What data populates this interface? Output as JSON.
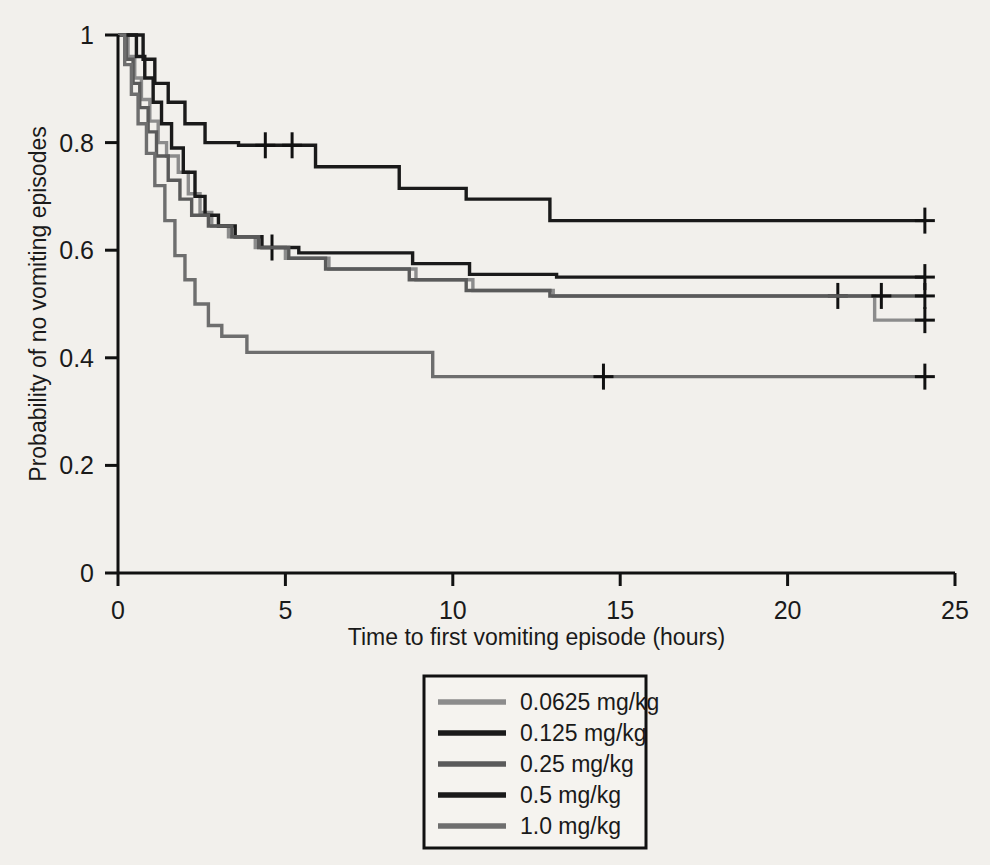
{
  "chart_data": {
    "type": "line",
    "subtype": "kaplan-meier-step",
    "title": "",
    "xlabel": "Time to first vomiting episode (hours)",
    "ylabel": "Probability of no vomiting episodes",
    "xlim": [
      0,
      25
    ],
    "ylim": [
      0,
      1
    ],
    "xticks": [
      0,
      5,
      10,
      15,
      20,
      25
    ],
    "xtick_labels": [
      "0",
      "5",
      "10",
      "15",
      "20",
      "25"
    ],
    "yticks": [
      0,
      0.2,
      0.4,
      0.6,
      0.8,
      1
    ],
    "ytick_labels": [
      "0",
      "0.2",
      "0.4",
      "0.6",
      "0.8",
      "1"
    ],
    "grid": false,
    "legend_position": "bottom-center",
    "series": [
      {
        "name": "0.0625 mg/kg",
        "color": "#8c8c8c",
        "points": [
          [
            0.0,
            1.0
          ],
          [
            0.3,
            1.0
          ],
          [
            0.3,
            0.96
          ],
          [
            0.5,
            0.96
          ],
          [
            0.5,
            0.92
          ],
          [
            0.7,
            0.92
          ],
          [
            0.7,
            0.88
          ],
          [
            0.95,
            0.88
          ],
          [
            0.95,
            0.84
          ],
          [
            1.2,
            0.84
          ],
          [
            1.2,
            0.8
          ],
          [
            1.45,
            0.8
          ],
          [
            1.45,
            0.775
          ],
          [
            1.8,
            0.775
          ],
          [
            1.8,
            0.745
          ],
          [
            2.1,
            0.745
          ],
          [
            2.1,
            0.705
          ],
          [
            2.45,
            0.705
          ],
          [
            2.45,
            0.67
          ],
          [
            2.8,
            0.67
          ],
          [
            2.8,
            0.645
          ],
          [
            3.3,
            0.645
          ],
          [
            3.3,
            0.625
          ],
          [
            4.1,
            0.625
          ],
          [
            4.1,
            0.605
          ],
          [
            5.0,
            0.605
          ],
          [
            5.0,
            0.585
          ],
          [
            6.3,
            0.585
          ],
          [
            6.3,
            0.565
          ],
          [
            8.9,
            0.565
          ],
          [
            8.9,
            0.545
          ],
          [
            10.6,
            0.545
          ],
          [
            10.6,
            0.525
          ],
          [
            13.0,
            0.525
          ],
          [
            13.0,
            0.515
          ],
          [
            22.6,
            0.515
          ],
          [
            22.6,
            0.47
          ],
          [
            24.1,
            0.47
          ]
        ],
        "censored": [
          [
            21.5,
            0.515
          ],
          [
            24.1,
            0.47
          ]
        ]
      },
      {
        "name": "0.125 mg/kg",
        "color": "#1a1a1a",
        "points": [
          [
            0.0,
            1.0
          ],
          [
            0.55,
            1.0
          ],
          [
            0.55,
            0.96
          ],
          [
            0.8,
            0.96
          ],
          [
            0.8,
            0.92
          ],
          [
            1.05,
            0.92
          ],
          [
            1.05,
            0.875
          ],
          [
            1.3,
            0.875
          ],
          [
            1.3,
            0.835
          ],
          [
            1.6,
            0.835
          ],
          [
            1.6,
            0.79
          ],
          [
            1.95,
            0.79
          ],
          [
            1.95,
            0.745
          ],
          [
            2.3,
            0.745
          ],
          [
            2.3,
            0.7
          ],
          [
            2.6,
            0.7
          ],
          [
            2.6,
            0.665
          ],
          [
            3.0,
            0.665
          ],
          [
            3.0,
            0.645
          ],
          [
            3.5,
            0.645
          ],
          [
            3.5,
            0.625
          ],
          [
            4.3,
            0.625
          ],
          [
            4.3,
            0.605
          ],
          [
            5.4,
            0.605
          ],
          [
            5.4,
            0.595
          ],
          [
            8.8,
            0.595
          ],
          [
            8.8,
            0.575
          ],
          [
            10.5,
            0.575
          ],
          [
            10.5,
            0.555
          ],
          [
            13.1,
            0.555
          ],
          [
            13.1,
            0.55
          ],
          [
            24.1,
            0.55
          ]
        ],
        "censored": [
          [
            4.6,
            0.605
          ],
          [
            24.1,
            0.55
          ]
        ]
      },
      {
        "name": "0.25 mg/kg",
        "color": "#5a5a5a",
        "points": [
          [
            0.0,
            1.0
          ],
          [
            0.25,
            1.0
          ],
          [
            0.25,
            0.955
          ],
          [
            0.45,
            0.955
          ],
          [
            0.45,
            0.91
          ],
          [
            0.65,
            0.91
          ],
          [
            0.65,
            0.865
          ],
          [
            0.9,
            0.865
          ],
          [
            0.9,
            0.82
          ],
          [
            1.15,
            0.82
          ],
          [
            1.15,
            0.775
          ],
          [
            1.5,
            0.775
          ],
          [
            1.5,
            0.73
          ],
          [
            1.85,
            0.73
          ],
          [
            1.85,
            0.695
          ],
          [
            2.2,
            0.695
          ],
          [
            2.2,
            0.665
          ],
          [
            2.7,
            0.665
          ],
          [
            2.7,
            0.645
          ],
          [
            3.4,
            0.645
          ],
          [
            3.4,
            0.625
          ],
          [
            4.2,
            0.625
          ],
          [
            4.2,
            0.605
          ],
          [
            5.1,
            0.605
          ],
          [
            5.1,
            0.585
          ],
          [
            6.2,
            0.585
          ],
          [
            6.2,
            0.565
          ],
          [
            8.7,
            0.565
          ],
          [
            8.7,
            0.545
          ],
          [
            10.4,
            0.545
          ],
          [
            10.4,
            0.525
          ],
          [
            12.9,
            0.525
          ],
          [
            12.9,
            0.515
          ],
          [
            24.1,
            0.515
          ]
        ],
        "censored": [
          [
            22.8,
            0.515
          ],
          [
            24.1,
            0.515
          ]
        ]
      },
      {
        "name": "0.5 mg/kg",
        "color": "#1a1a1a",
        "points": [
          [
            0.0,
            1.0
          ],
          [
            0.75,
            1.0
          ],
          [
            0.75,
            0.955
          ],
          [
            1.1,
            0.955
          ],
          [
            1.1,
            0.91
          ],
          [
            1.5,
            0.91
          ],
          [
            1.5,
            0.875
          ],
          [
            2.0,
            0.875
          ],
          [
            2.0,
            0.835
          ],
          [
            2.6,
            0.835
          ],
          [
            2.6,
            0.8
          ],
          [
            3.6,
            0.8
          ],
          [
            3.6,
            0.795
          ],
          [
            5.9,
            0.795
          ],
          [
            5.9,
            0.755
          ],
          [
            8.4,
            0.755
          ],
          [
            8.4,
            0.715
          ],
          [
            10.4,
            0.715
          ],
          [
            10.4,
            0.695
          ],
          [
            12.9,
            0.695
          ],
          [
            12.9,
            0.655
          ],
          [
            24.1,
            0.655
          ]
        ],
        "censored": [
          [
            4.4,
            0.795
          ],
          [
            5.2,
            0.795
          ],
          [
            24.1,
            0.655
          ]
        ]
      },
      {
        "name": "1.0 mg/kg",
        "color": "#6e6e6e",
        "points": [
          [
            0.0,
            1.0
          ],
          [
            0.2,
            1.0
          ],
          [
            0.2,
            0.945
          ],
          [
            0.4,
            0.945
          ],
          [
            0.4,
            0.89
          ],
          [
            0.6,
            0.89
          ],
          [
            0.6,
            0.835
          ],
          [
            0.85,
            0.835
          ],
          [
            0.85,
            0.78
          ],
          [
            1.1,
            0.78
          ],
          [
            1.1,
            0.72
          ],
          [
            1.4,
            0.72
          ],
          [
            1.4,
            0.655
          ],
          [
            1.7,
            0.655
          ],
          [
            1.7,
            0.59
          ],
          [
            2.0,
            0.59
          ],
          [
            2.0,
            0.545
          ],
          [
            2.3,
            0.545
          ],
          [
            2.3,
            0.5
          ],
          [
            2.7,
            0.5
          ],
          [
            2.7,
            0.46
          ],
          [
            3.1,
            0.46
          ],
          [
            3.1,
            0.44
          ],
          [
            3.85,
            0.44
          ],
          [
            3.85,
            0.41
          ],
          [
            9.4,
            0.41
          ],
          [
            9.4,
            0.365
          ],
          [
            24.1,
            0.365
          ]
        ],
        "censored": [
          [
            14.5,
            0.365
          ],
          [
            24.1,
            0.365
          ]
        ]
      }
    ]
  },
  "legend": {
    "entries": [
      {
        "label": "0.0625 mg/kg",
        "color": "#8c8c8c"
      },
      {
        "label": "0.125 mg/kg",
        "color": "#1a1a1a"
      },
      {
        "label": "0.25 mg/kg",
        "color": "#5a5a5a"
      },
      {
        "label": "0.5 mg/kg",
        "color": "#1a1a1a"
      },
      {
        "label": "1.0 mg/kg",
        "color": "#6e6e6e"
      }
    ]
  },
  "axes": {
    "x_title": "Time to first vomiting episode (hours)",
    "y_title": "Probability of no vomiting episodes",
    "axis_color": "#111111",
    "background": "#f2f0ec"
  }
}
